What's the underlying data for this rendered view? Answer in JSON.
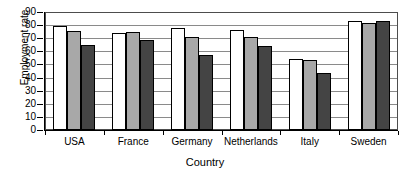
{
  "chart_data": {
    "type": "bar",
    "title": "",
    "xlabel": "Country",
    "ylabel": "Employment rate",
    "categories": [
      "USA",
      "France",
      "Germany",
      "Netherlands",
      "Italy",
      "Sweden"
    ],
    "yticks": [
      0,
      10,
      20,
      30,
      40,
      50,
      60,
      70,
      80,
      90
    ],
    "ylim": [
      0,
      90
    ],
    "grid": true,
    "legend": "none",
    "series": [
      {
        "name": "series-1",
        "color": "#ffffff",
        "values": [
          79,
          74,
          78,
          76,
          54,
          83.5
        ]
      },
      {
        "name": "series-2",
        "color": "#a8a8a8",
        "values": [
          75.5,
          75,
          71,
          71,
          53.5,
          82
        ]
      },
      {
        "name": "series-3",
        "color": "#444444",
        "values": [
          65,
          68.5,
          57,
          64,
          43.5,
          83
        ]
      }
    ]
  }
}
